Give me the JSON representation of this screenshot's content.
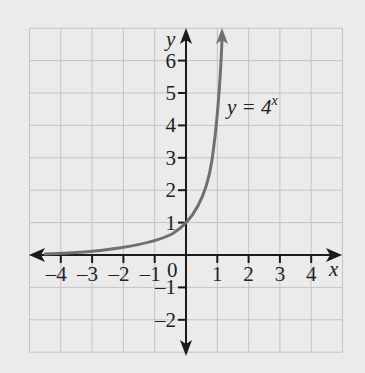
{
  "chart_data": {
    "type": "line",
    "title": "",
    "function_label": "y=4^x",
    "label_base": "y = 4",
    "label_exp": "x",
    "xlabel": "x",
    "ylabel": "y",
    "xlim": [
      -5,
      5
    ],
    "ylim": [
      -3,
      7
    ],
    "grid": true,
    "x_ticks": [
      "-4",
      "-3",
      "-2",
      "-1",
      "1",
      "2",
      "3",
      "4"
    ],
    "y_ticks": [
      "6",
      "5",
      "4",
      "3",
      "2",
      "1",
      "-1",
      "-2"
    ],
    "origin_label": "0",
    "series": [
      {
        "name": "y=4^x",
        "x": [
          -5,
          -4,
          -3,
          -2,
          -1,
          0,
          0.5,
          1,
          1.2,
          1.3
        ],
        "values": [
          0.001,
          0.004,
          0.016,
          0.0625,
          0.25,
          1,
          2,
          4,
          5.28,
          6.06
        ]
      }
    ],
    "colors": {
      "curve": "#707070",
      "axes": "#1a1a1a",
      "grid": "#c4c4c4",
      "background": "#ebebeb"
    }
  }
}
